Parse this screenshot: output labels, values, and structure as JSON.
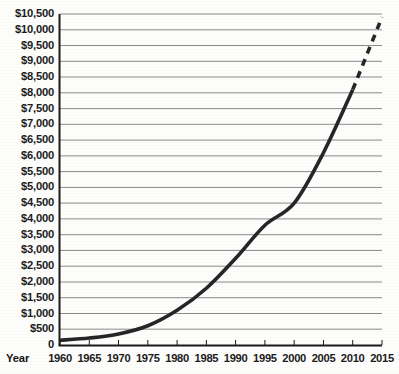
{
  "chart_data": {
    "type": "line",
    "title": "",
    "subtitle": "",
    "xlabel": "Year",
    "ylabel": "",
    "grid": true,
    "legend": "none",
    "xlim": [
      1960,
      2015
    ],
    "ylim": [
      0,
      10500
    ],
    "x_ticks": [
      1960,
      1965,
      1970,
      1975,
      1980,
      1985,
      1990,
      1995,
      2000,
      2005,
      2010,
      2015
    ],
    "x_tick_labels": [
      "1960",
      "1965",
      "1970",
      "1975",
      "1980",
      "1985",
      "1990",
      "1995",
      "2000",
      "2005",
      "2010",
      "2015"
    ],
    "y_ticks": [
      0,
      500,
      1000,
      1500,
      2000,
      2500,
      3000,
      3500,
      4000,
      4500,
      5000,
      5500,
      6000,
      6500,
      7000,
      7500,
      8000,
      8500,
      9000,
      9500,
      10000,
      10500
    ],
    "y_tick_labels": [
      "0",
      "$500",
      "$1,000",
      "$1,500",
      "$2,000",
      "$2,500",
      "$3,000",
      "$3,500",
      "$4,000",
      "$4,500",
      "$5,000",
      "$5,500",
      "$6,000",
      "$6,500",
      "$7,000",
      "$7,500",
      "$8,000",
      "$8,500",
      "$9,000",
      "$9,500",
      "$10,000",
      "$10,500"
    ],
    "series": [
      {
        "name": "actual",
        "style": "solid",
        "color": "#262626",
        "x": [
          1960,
          1965,
          1970,
          1975,
          1980,
          1985,
          1990,
          1995,
          2000,
          2005,
          2010
        ],
        "values": [
          150,
          220,
          350,
          610,
          1100,
          1800,
          2750,
          3800,
          4500,
          6100,
          8100
        ]
      },
      {
        "name": "projected",
        "style": "dashed",
        "color": "#262626",
        "x": [
          2010,
          2015
        ],
        "values": [
          8100,
          10400
        ]
      }
    ],
    "colors": {
      "line": "#262626",
      "grid": "#8a8a8a",
      "axis": "#1a1a1a",
      "background": "#fdfdfc",
      "text": "#1c1c1c"
    }
  }
}
